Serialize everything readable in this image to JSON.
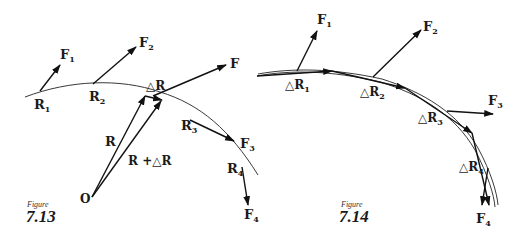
{
  "figure_713": {
    "caption_prefix": "Figure",
    "caption_number": "7.13",
    "labels": {
      "R1": "R",
      "R1_sub": "1",
      "R2": "R",
      "R2_sub": "2",
      "R3": "R",
      "R3_sub": "3",
      "R4": "R",
      "R4_sub": "4",
      "F1": "F",
      "F1_sub": "1",
      "F2": "F",
      "F2_sub": "2",
      "F3": "F",
      "F3_sub": "3",
      "F4": "F",
      "F4_sub": "4",
      "F": "F",
      "dR": "△R",
      "R": "R",
      "RplusdR": "R +△R",
      "O": "O"
    }
  },
  "figure_714": {
    "caption_prefix": "Figure",
    "caption_number": "7.14",
    "labels": {
      "F1": "F",
      "F1_sub": "1",
      "F2": "F",
      "F2_sub": "2",
      "F3": "F",
      "F3_sub": "3",
      "F4": "F",
      "F4_sub": "4",
      "dR1": "△R",
      "dR1_sub": "1",
      "dR2": "△R",
      "dR2_sub": "2",
      "dR3": "△R",
      "dR3_sub": "3",
      "dR4": "△R",
      "dR4_sub": "4"
    }
  }
}
